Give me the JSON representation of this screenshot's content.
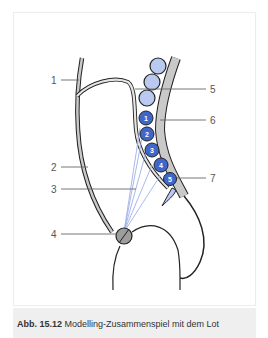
{
  "figure": {
    "labels": [
      {
        "id": "1",
        "text": "1"
      },
      {
        "id": "2",
        "text": "2"
      },
      {
        "id": "3",
        "text": "3"
      },
      {
        "id": "4",
        "text": "4"
      },
      {
        "id": "5",
        "text": "5"
      },
      {
        "id": "6",
        "text": "6"
      },
      {
        "id": "7",
        "text": "7"
      }
    ],
    "numbered_circles": [
      "1",
      "2",
      "3",
      "4",
      "5"
    ],
    "colors": {
      "circle_light": "#b9c9ef",
      "circle_dark": "#3f67c9",
      "band_gray": "#c9c9c9",
      "outline": "#222222",
      "fiber_lines": "#9fb0e8",
      "leader_lines": "#666666"
    }
  },
  "caption": {
    "prefix": "Abb. 15.12",
    "text": "Modelling-Zusammenspiel mit dem Lot"
  }
}
